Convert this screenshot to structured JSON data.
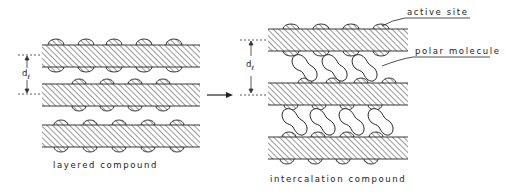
{
  "diagram": {
    "left": {
      "caption": "layered compound",
      "spacing_label": "d",
      "spacing_sub": "ℓ",
      "layers": 3
    },
    "arrow": "transition-arrow",
    "right": {
      "caption": "intercalation compound",
      "spacing_label": "d",
      "spacing_sub": "ℓ",
      "layers": 3,
      "annotations": [
        "active site",
        "polar molecule"
      ]
    },
    "colors": {
      "ink": "#222222",
      "background": "#ffffff"
    }
  }
}
